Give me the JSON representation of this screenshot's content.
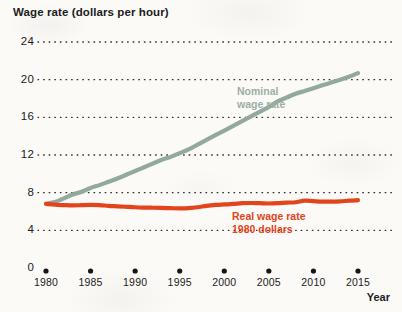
{
  "chart_data": {
    "type": "line",
    "title": "Wage rate (dollars per hour)",
    "xlabel": "Year",
    "ylabel": "Wage rate (dollars per hour)",
    "xlim": [
      1980,
      2015
    ],
    "ylim": [
      0,
      24
    ],
    "grid": "horizontal-dotted",
    "legend_position": "inline-annotation",
    "y_ticks": [
      "0",
      "4",
      "8",
      "12",
      "16",
      "20",
      "24"
    ],
    "y_tick_values": [
      0,
      4,
      8,
      12,
      16,
      20,
      24
    ],
    "x_ticks": [
      "1980",
      "1985",
      "1990",
      "1995",
      "2000",
      "2005",
      "2010",
      "2015"
    ],
    "x_tick_values": [
      1980,
      1985,
      1990,
      1995,
      2000,
      2005,
      2010,
      2015
    ],
    "x": [
      1980,
      1981,
      1982,
      1983,
      1984,
      1985,
      1986,
      1987,
      1988,
      1989,
      1990,
      1991,
      1992,
      1993,
      1994,
      1995,
      1996,
      1997,
      1998,
      1999,
      2000,
      2001,
      2002,
      2003,
      2004,
      2005,
      2006,
      2007,
      2008,
      2009,
      2010,
      2011,
      2012,
      2013,
      2014,
      2015
    ],
    "series": [
      {
        "name": "Nominal wage rate",
        "label": "Nominal\nwage rate",
        "label_line1": "Nominal",
        "label_line2": "wage rate",
        "color": "#92a99d",
        "values": [
          6.85,
          7.0,
          7.4,
          7.8,
          8.1,
          8.5,
          8.8,
          9.15,
          9.5,
          9.9,
          10.3,
          10.7,
          11.1,
          11.5,
          11.8,
          12.2,
          12.6,
          13.1,
          13.6,
          14.1,
          14.6,
          15.1,
          15.6,
          16.1,
          16.6,
          17.1,
          17.7,
          18.1,
          18.5,
          18.8,
          19.1,
          19.4,
          19.7,
          20.0,
          20.3,
          20.7
        ]
      },
      {
        "name": "Real wage rate 1980 dollars",
        "label": "Real wage rate\n1980 dollars",
        "label_line1": "Real wage rate",
        "label_line2": "1980 dollars",
        "color": "#e2451b",
        "values": [
          6.8,
          6.72,
          6.68,
          6.65,
          6.68,
          6.7,
          6.68,
          6.6,
          6.55,
          6.5,
          6.45,
          6.42,
          6.4,
          6.38,
          6.35,
          6.33,
          6.35,
          6.45,
          6.6,
          6.7,
          6.75,
          6.8,
          6.88,
          6.9,
          6.88,
          6.85,
          6.88,
          6.95,
          6.98,
          7.15,
          7.1,
          7.05,
          7.05,
          7.08,
          7.15,
          7.2
        ]
      }
    ]
  }
}
